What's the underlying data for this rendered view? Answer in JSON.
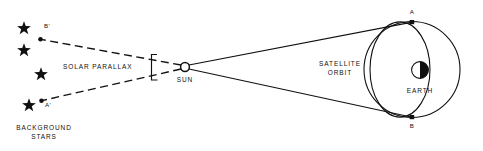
{
  "diagram": {
    "colors": {
      "ink": "#111111",
      "background": "#ffffff",
      "earth_shadow": "#111111",
      "earth_light": "#ffffff"
    },
    "labels": {
      "solar_parallax": "SOLAR PARALLAX",
      "sun": "SUN",
      "satellite_orbit_line1": "SATELLITE",
      "satellite_orbit_line2": "ORBIT",
      "earth": "EARTH",
      "background_stars_line1": "BACKGROUND",
      "background_stars_line2": "STARS",
      "point_a": "A",
      "point_b": "B",
      "point_a_prime": "A'",
      "point_b_prime": "B'"
    },
    "stars": [
      {
        "name": "star-1",
        "x": 24,
        "y": 27
      },
      {
        "name": "star-2",
        "x": 24,
        "y": 49
      },
      {
        "name": "star-3",
        "x": 41,
        "y": 73
      },
      {
        "name": "star-4",
        "x": 29,
        "y": 104
      }
    ],
    "nodes": {
      "sun": {
        "x": 185,
        "y": 67,
        "r": 4.6
      },
      "point_a": {
        "x": 412,
        "y": 22
      },
      "point_b": {
        "x": 412,
        "y": 117
      },
      "point_a_prime": {
        "x": 41,
        "y": 101
      },
      "point_b_prime": {
        "x": 40,
        "y": 39
      },
      "earth": {
        "x": 420,
        "y": 70,
        "r": 8.5
      },
      "satellite_orbit_circle": {
        "x": 412,
        "y": 69,
        "r": 48
      },
      "orbit_ellipse": {
        "x": 400,
        "y": 69,
        "rx": 30,
        "ry": 47
      }
    },
    "rays": {
      "sight_line_a": "Sun to orbit point A",
      "sight_line_b": "Sun to orbit point B",
      "projection_a_prime": "Sun to background star position A'",
      "projection_b_prime": "Sun to background star position B'"
    },
    "angle_marker": {
      "name": "parallax-angle-bracket",
      "x": 152,
      "y_top": 55,
      "y_bottom": 80
    }
  }
}
